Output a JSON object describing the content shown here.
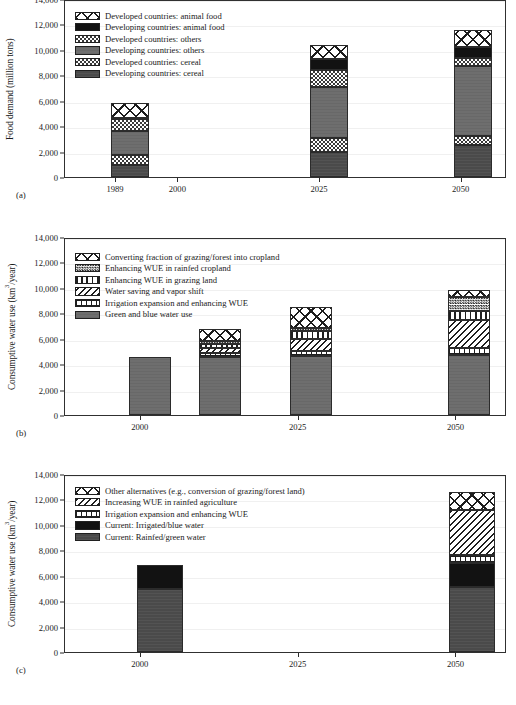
{
  "figure": {
    "panels": [
      "a",
      "b",
      "c"
    ]
  },
  "chart_data": [
    {
      "panel": "a",
      "tag": "(a)",
      "type": "bar",
      "stacked": true,
      "title": "",
      "xlabel": "",
      "ylabel": "Food demand (million tons)",
      "ylim": [
        0,
        14000
      ],
      "yticks": [
        "0",
        "2,000",
        "4,000",
        "6,000",
        "8,000",
        "10,000",
        "12,000",
        "14,000"
      ],
      "ytick_values": [
        0,
        2000,
        4000,
        6000,
        8000,
        10000,
        12000,
        14000
      ],
      "xticks": [
        "1989",
        "2000",
        "2025",
        "2050"
      ],
      "xtick_values": [
        1989,
        2000,
        2025,
        2050
      ],
      "xlim": [
        1980,
        2058
      ],
      "grid": false,
      "legend_position": "upper-left",
      "series": [
        {
          "name": "Developed countries: animal food",
          "pattern": "p-xhatch",
          "values": [
            1150,
            1100,
            1350
          ]
        },
        {
          "name": "Developing countries: animal food",
          "pattern": "p-black",
          "values": [
            60,
            900,
            800
          ]
        },
        {
          "name": "Developed countries: others",
          "pattern": "p-checker",
          "values": [
            1000,
            1300,
            700
          ]
        },
        {
          "name": "Developing countries: others",
          "pattern": "p-greymid",
          "values": [
            1900,
            4000,
            5450
          ]
        },
        {
          "name": "Developed countries: cereal",
          "pattern": "p-checker",
          "values": [
            750,
            1150,
            700
          ]
        },
        {
          "name": "Developing countries: cereal",
          "pattern": "p-greydark",
          "values": [
            950,
            1950,
            2550
          ]
        }
      ],
      "categories": [
        "1989",
        "2025",
        "2050"
      ],
      "totals": [
        5810,
        10400,
        11550
      ]
    },
    {
      "panel": "b",
      "tag": "(b)",
      "type": "bar",
      "stacked": true,
      "title": "",
      "xlabel": "",
      "ylabel": "Consumptive water use (km3/year)",
      "ylabel_html": "Consumptive water use (km<sup>3</sup>/year)",
      "ylim": [
        0,
        14000
      ],
      "yticks": [
        "0",
        "2,000",
        "4,000",
        "6,000",
        "8,000",
        "10,000",
        "12,000",
        "14,000"
      ],
      "ytick_values": [
        0,
        2000,
        4000,
        6000,
        8000,
        10000,
        12000,
        14000
      ],
      "xticks": [
        "2000",
        "2025",
        "2050"
      ],
      "xtick_values": [
        2000,
        2025,
        2050
      ],
      "xlim": [
        1988,
        2058
      ],
      "grid": false,
      "legend_position": "upper-left",
      "series": [
        {
          "name": "Converting fraction of grazing/forest into cropland",
          "pattern": "p-xhatch",
          "values": [
            0,
            950,
            1650,
            550
          ]
        },
        {
          "name": "Enhancing WUE in rainfed cropland",
          "pattern": "p-checkdense",
          "values": [
            0,
            280,
            250,
            1150
          ]
        },
        {
          "name": "Enhancing WUE in grazing land",
          "pattern": "p-vbar",
          "values": [
            0,
            300,
            600,
            650
          ]
        },
        {
          "name": "Water saving and vapor shift",
          "pattern": "p-dhatch",
          "values": [
            0,
            400,
            950,
            2200
          ]
        },
        {
          "name": "Irrigation expansion and enhancing WUE",
          "pattern": "p-grid",
          "values": [
            0,
            250,
            400,
            600
          ]
        },
        {
          "name": "Green and blue water use",
          "pattern": "p-greymid",
          "values": [
            4550,
            4600,
            4650,
            4700
          ]
        }
      ],
      "categories": [
        "2000",
        "2012",
        "2025",
        "2050"
      ],
      "totals": [
        4550,
        6780,
        8500,
        9850
      ]
    },
    {
      "panel": "c",
      "tag": "(c)",
      "type": "bar",
      "stacked": true,
      "title": "",
      "xlabel": "",
      "ylabel": "Consumptive water use (km3/year)",
      "ylabel_html": "Consumptive water use (km<sup>3</sup>/year)",
      "ylim": [
        0,
        14000
      ],
      "yticks": [
        "0",
        "2,000",
        "4,000",
        "6,000",
        "8,000",
        "10,000",
        "12,000",
        "14,000"
      ],
      "ytick_values": [
        0,
        2000,
        4000,
        6000,
        8000,
        10000,
        12000,
        14000
      ],
      "xticks": [
        "2000",
        "2025",
        "2050"
      ],
      "xtick_values": [
        2000,
        2025,
        2050
      ],
      "xlim": [
        1988,
        2058
      ],
      "grid": false,
      "legend_position": "upper-left",
      "series": [
        {
          "name": "Other alternatives (e.g., conversion of grazing/forest land)",
          "pattern": "p-xhatch",
          "values": [
            0,
            1350
          ]
        },
        {
          "name": "Increasing WUE in rainfed agriculture",
          "pattern": "p-dhatch",
          "values": [
            0,
            3600
          ]
        },
        {
          "name": "Irrigation expansion and enhancing WUE",
          "pattern": "p-grid",
          "values": [
            0,
            600
          ]
        },
        {
          "name": "Current: Irrigated/blue water",
          "pattern": "p-black",
          "values": [
            1880,
            1850
          ]
        },
        {
          "name": "Current: Rainfed/green water",
          "pattern": "p-greydark",
          "values": [
            4970,
            5150
          ]
        }
      ],
      "categories": [
        "2000",
        "2050"
      ],
      "totals": [
        6850,
        12550
      ]
    }
  ]
}
